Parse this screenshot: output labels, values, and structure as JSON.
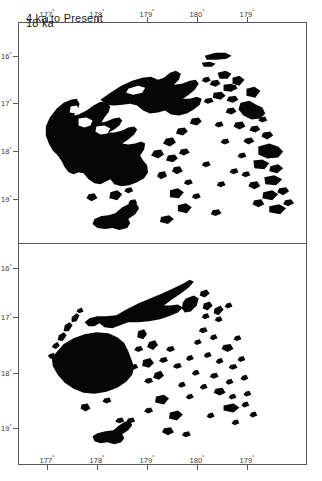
{
  "figure": {
    "kind": "two-panel paleogeographic map of the Fiji islands",
    "background_color": "#ffffff",
    "frame_color": "#555a5e",
    "land_color": "#060606"
  },
  "panels": [
    {
      "id": "panel-top",
      "title": "18 ka",
      "x_axis_position": "top",
      "x_ticks": [
        {
          "label": "177°",
          "x": 47
        },
        {
          "label": "178°",
          "x": 97
        },
        {
          "label": "179°",
          "x": 147
        },
        {
          "label": "180°",
          "x": 197
        },
        {
          "label": "179°",
          "x": 247
        }
      ],
      "y_ticks": [
        {
          "label": "16°",
          "y": 56
        },
        {
          "label": "17°",
          "y": 103
        },
        {
          "label": "18°",
          "y": 151
        },
        {
          "label": "19°",
          "y": 199
        }
      ]
    },
    {
      "id": "panel-bottom",
      "title": "4 ka to Present",
      "x_axis_position": "bottom",
      "x_ticks": [
        {
          "label": "177°",
          "x": 47
        },
        {
          "label": "178°",
          "x": 97
        },
        {
          "label": "179°",
          "x": 147
        },
        {
          "label": "180°",
          "x": 197
        },
        {
          "label": "179°",
          "x": 247
        }
      ],
      "y_ticks": [
        {
          "label": "16°",
          "y": 268
        },
        {
          "label": "17°",
          "y": 317
        },
        {
          "label": "18°",
          "y": 373
        },
        {
          "label": "19°",
          "y": 428
        }
      ]
    }
  ],
  "chart_data": {
    "type": "map",
    "xlabel": "",
    "ylabel": "",
    "xlim": [
      176.6,
      178.8
    ],
    "ylim": [
      -19.6,
      -15.6
    ],
    "grid": false,
    "legend": null,
    "panels": [
      {
        "name": "18 ka",
        "description": "Lowered sea level merges Viti Levu, Vanua Levu, Yasawa and Lomaiviti into large continuous landmasses; extensive shelf exposed.",
        "x_tick_labels": [
          "177°",
          "178°",
          "179°",
          "180°",
          "179°"
        ],
        "y_tick_labels": [
          "16°",
          "17°",
          "18°",
          "19°"
        ]
      },
      {
        "name": "4 ka to Present",
        "description": "Modern shorelines: separate Viti Levu, Vanua Levu, Taveuni, Kadavu and the scattered Lau group islands.",
        "x_tick_labels": [
          "177°",
          "178°",
          "179°",
          "180°",
          "179°"
        ],
        "y_tick_labels": [
          "16°",
          "17°",
          "18°",
          "19°"
        ]
      }
    ]
  }
}
